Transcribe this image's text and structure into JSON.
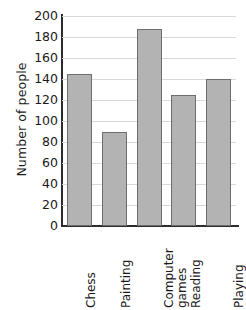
{
  "chart_data": {
    "type": "bar",
    "title": "",
    "xlabel": "",
    "ylabel": "Number of people",
    "ylim": [
      0,
      200
    ],
    "ytick_step": 20,
    "yticks": [
      200,
      180,
      160,
      140,
      120,
      100,
      80,
      60,
      40,
      20,
      0
    ],
    "grid": true,
    "legend": "none",
    "categories": [
      "Chess",
      "Painting",
      "Computer games",
      "Reading",
      "Playing football"
    ],
    "category_lines": [
      [
        "Chess"
      ],
      [
        "Painting"
      ],
      [
        "Computer",
        "games"
      ],
      [
        "Reading"
      ],
      [
        "Playing",
        "football"
      ]
    ],
    "values": [
      145,
      90,
      188,
      125,
      140
    ],
    "bar_fill": "#b3b3b3",
    "bar_border": "#6e6e6e",
    "axis_color": "#2b2b2b",
    "grid_color": "#d8d8d8"
  }
}
